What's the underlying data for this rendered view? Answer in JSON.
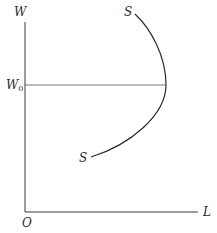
{
  "diagram": {
    "type": "backward-bending labour supply curve",
    "y_axis_label": "W",
    "x_axis_label": "L",
    "origin_label": "O",
    "reference_line_label": "W",
    "reference_line_subscript": "0",
    "curve_label_top": "S",
    "curve_label_bottom": "S",
    "colors": {
      "background": "#ffffff",
      "lines": "#2a2a2a"
    }
  }
}
